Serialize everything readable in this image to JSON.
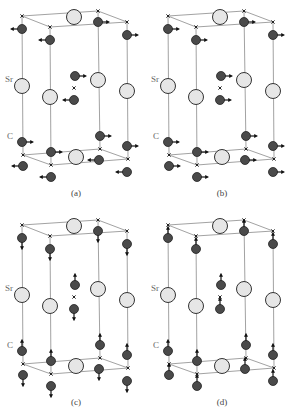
{
  "figure": {
    "colors": {
      "cell_edge": "#8a8a8a",
      "sr_fill": "#e6e6e6",
      "sr_stroke": "#333333",
      "c_fill": "#4a4a4a",
      "c_stroke": "#222222",
      "arrow": "#111111",
      "label": "#555555"
    },
    "atom_labels": {
      "sr": "Sr",
      "c": "C"
    },
    "panels": [
      {
        "id": "a",
        "label": "(a)",
        "mode": "in-plane, alternating left/right",
        "offset": [
          0,
          0
        ]
      },
      {
        "id": "b",
        "label": "(b)",
        "mode": "in-plane, all right",
        "offset": [
          146,
          0
        ]
      },
      {
        "id": "c",
        "label": "(c)",
        "mode": "out-of-plane, opposite up/down",
        "offset": [
          0,
          209
        ]
      },
      {
        "id": "d",
        "label": "(d)",
        "mode": "out-of-plane, all up",
        "offset": [
          146,
          209
        ]
      }
    ]
  }
}
